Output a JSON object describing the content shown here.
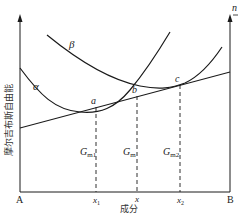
{
  "diagram": {
    "y_axis_label": "摩尔吉布斯自由能",
    "x_axis_label": "成分",
    "top_right_label": "n",
    "left_end_label": "A",
    "right_end_label": "B",
    "curves": [
      {
        "name": "alpha",
        "label": "α"
      },
      {
        "name": "beta",
        "label": "β"
      }
    ],
    "points": [
      {
        "name": "a",
        "label": "a"
      },
      {
        "name": "b",
        "label": "b"
      },
      {
        "name": "c",
        "label": "c"
      }
    ],
    "x_ticks": [
      {
        "name": "x1",
        "label": "x",
        "sub": "1"
      },
      {
        "name": "x",
        "label": "x",
        "sub": ""
      },
      {
        "name": "x2",
        "label": "x",
        "sub": "2"
      }
    ],
    "energy_labels": [
      {
        "name": "Gm1",
        "label": "G",
        "sub": "m1"
      },
      {
        "name": "Gm",
        "label": "G",
        "sub": "m"
      },
      {
        "name": "Gm2",
        "label": "G",
        "sub": "m2"
      }
    ],
    "colors": {
      "line": "#1a1a1a",
      "background": "#ffffff"
    }
  }
}
